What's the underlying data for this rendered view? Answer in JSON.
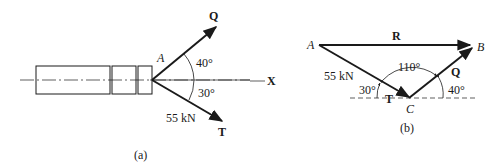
{
  "figure_a": {
    "caption": "(a)",
    "point_label": "A",
    "force_q_label": "Q",
    "force_t_label": "T",
    "axis_label": "X",
    "angle_q": "40°",
    "angle_t": "30°",
    "t_magnitude": "55 kN"
  },
  "figure_b": {
    "caption": "(b)",
    "point_a": "A",
    "point_b": "B",
    "point_c": "C",
    "resultant_label": "R",
    "force_q_label": "Q",
    "force_t_label": "T",
    "t_magnitude": "55 kN",
    "angle_c": "110°",
    "angle_t": "30°",
    "angle_q": "40°"
  },
  "colors": {
    "ink": "#1a1a1a",
    "background": "#ffffff"
  }
}
